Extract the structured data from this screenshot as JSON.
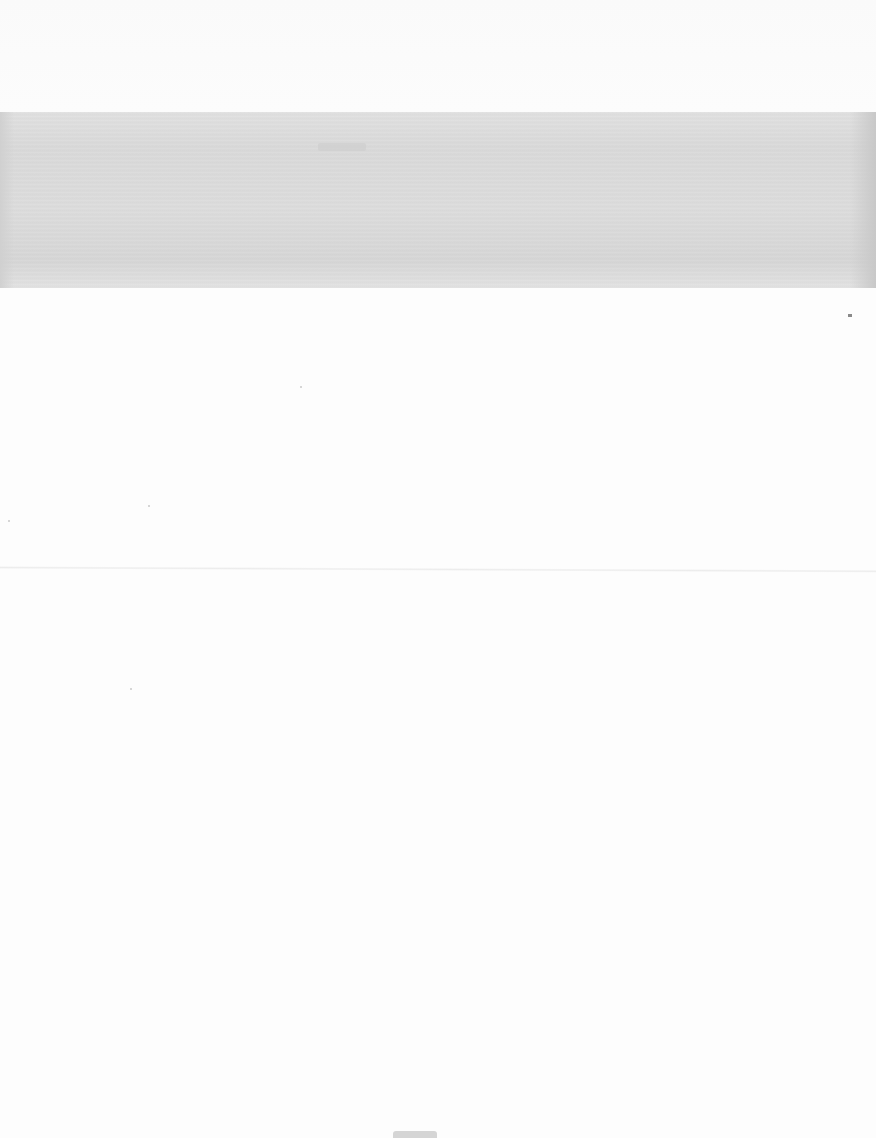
{
  "page": {
    "type": "blank scanned sheet",
    "background_color": "#fdfdfd",
    "band_color": "#dadada",
    "band": {
      "top": 112,
      "height": 176
    },
    "fold_line_y": 566,
    "band_text": "",
    "footer_mark": ""
  }
}
